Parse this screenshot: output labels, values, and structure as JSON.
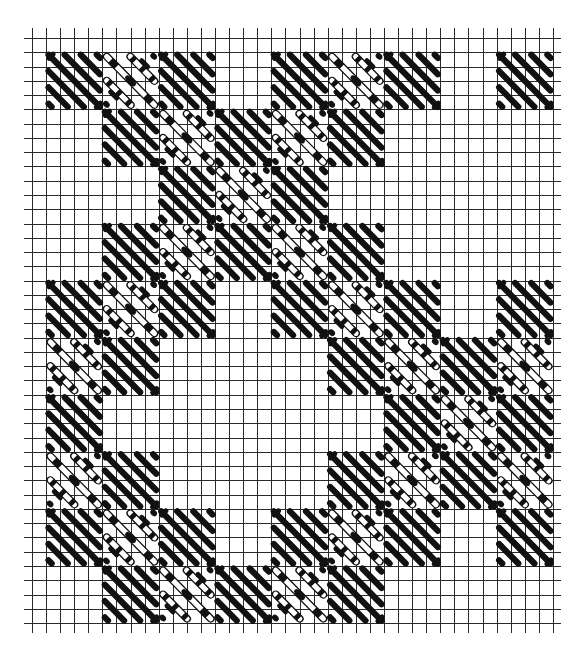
{
  "diagram": {
    "type": "needlepoint-stitch-chart",
    "grid": {
      "origin_x": 32,
      "origin_y": 38,
      "cell_w": 14.08,
      "cell_h": 14.27,
      "cols": 37,
      "rows": 41,
      "overhang": 8,
      "line_color": "#2a2a2a"
    },
    "block": {
      "size_cells": 4,
      "offset_cells": 1,
      "ink_color": "#111111",
      "paper_color": "#ffffff"
    },
    "legend": {
      "solid": "diagonal slanted stitch block (/)",
      "open": "reverse diagonal stitch block with outlined long stitches (\\)"
    },
    "blocks": [
      {
        "row": 0,
        "col": 0,
        "kind": "solid"
      },
      {
        "row": 0,
        "col": 1,
        "kind": "open"
      },
      {
        "row": 0,
        "col": 2,
        "kind": "solid"
      },
      {
        "row": 0,
        "col": 4,
        "kind": "solid"
      },
      {
        "row": 0,
        "col": 5,
        "kind": "open"
      },
      {
        "row": 0,
        "col": 6,
        "kind": "solid"
      },
      {
        "row": 0,
        "col": 8,
        "kind": "solid"
      },
      {
        "row": 1,
        "col": 1,
        "kind": "solid"
      },
      {
        "row": 1,
        "col": 2,
        "kind": "open"
      },
      {
        "row": 1,
        "col": 3,
        "kind": "solid"
      },
      {
        "row": 1,
        "col": 4,
        "kind": "open"
      },
      {
        "row": 1,
        "col": 5,
        "kind": "solid"
      },
      {
        "row": 2,
        "col": 2,
        "kind": "solid"
      },
      {
        "row": 2,
        "col": 3,
        "kind": "open"
      },
      {
        "row": 2,
        "col": 4,
        "kind": "solid"
      },
      {
        "row": 3,
        "col": 1,
        "kind": "solid"
      },
      {
        "row": 3,
        "col": 2,
        "kind": "open"
      },
      {
        "row": 3,
        "col": 3,
        "kind": "solid"
      },
      {
        "row": 3,
        "col": 4,
        "kind": "open"
      },
      {
        "row": 3,
        "col": 5,
        "kind": "solid"
      },
      {
        "row": 4,
        "col": 0,
        "kind": "solid"
      },
      {
        "row": 4,
        "col": 1,
        "kind": "open"
      },
      {
        "row": 4,
        "col": 2,
        "kind": "solid"
      },
      {
        "row": 4,
        "col": 4,
        "kind": "solid"
      },
      {
        "row": 4,
        "col": 5,
        "kind": "open"
      },
      {
        "row": 4,
        "col": 6,
        "kind": "solid"
      },
      {
        "row": 4,
        "col": 8,
        "kind": "solid"
      },
      {
        "row": 5,
        "col": 0,
        "kind": "open"
      },
      {
        "row": 5,
        "col": 1,
        "kind": "solid"
      },
      {
        "row": 5,
        "col": 5,
        "kind": "solid"
      },
      {
        "row": 5,
        "col": 6,
        "kind": "open"
      },
      {
        "row": 5,
        "col": 7,
        "kind": "solid"
      },
      {
        "row": 5,
        "col": 8,
        "kind": "open"
      },
      {
        "row": 6,
        "col": 0,
        "kind": "solid"
      },
      {
        "row": 6,
        "col": 6,
        "kind": "solid"
      },
      {
        "row": 6,
        "col": 7,
        "kind": "open"
      },
      {
        "row": 6,
        "col": 8,
        "kind": "solid"
      },
      {
        "row": 7,
        "col": 0,
        "kind": "open"
      },
      {
        "row": 7,
        "col": 1,
        "kind": "solid"
      },
      {
        "row": 7,
        "col": 5,
        "kind": "solid"
      },
      {
        "row": 7,
        "col": 6,
        "kind": "open"
      },
      {
        "row": 7,
        "col": 7,
        "kind": "solid"
      },
      {
        "row": 7,
        "col": 8,
        "kind": "open"
      },
      {
        "row": 8,
        "col": 0,
        "kind": "solid"
      },
      {
        "row": 8,
        "col": 1,
        "kind": "open"
      },
      {
        "row": 8,
        "col": 2,
        "kind": "solid"
      },
      {
        "row": 8,
        "col": 4,
        "kind": "solid"
      },
      {
        "row": 8,
        "col": 5,
        "kind": "open"
      },
      {
        "row": 8,
        "col": 6,
        "kind": "solid"
      },
      {
        "row": 8,
        "col": 8,
        "kind": "solid"
      },
      {
        "row": 9,
        "col": 1,
        "kind": "solid"
      },
      {
        "row": 9,
        "col": 2,
        "kind": "open"
      },
      {
        "row": 9,
        "col": 3,
        "kind": "solid"
      },
      {
        "row": 9,
        "col": 4,
        "kind": "open"
      },
      {
        "row": 9,
        "col": 5,
        "kind": "solid"
      }
    ]
  }
}
